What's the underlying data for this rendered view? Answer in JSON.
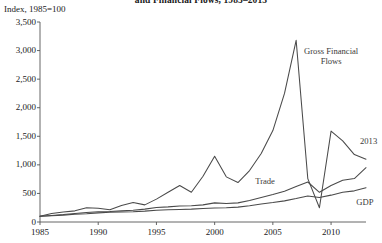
{
  "figure": {
    "title": "and Financial Flows, 1985–2013",
    "axis_note": "Index, 1985=100"
  },
  "chart_data": {
    "type": "line",
    "title": "and Financial Flows, 1985–2013",
    "subtitle": "",
    "xlabel": "",
    "ylabel": "Index, 1985=100",
    "xlim": [
      1985,
      2013
    ],
    "ylim": [
      0,
      3500
    ],
    "grid": false,
    "legend_position": "inline-annotations",
    "ytick_labels": [
      "0",
      "500",
      "1,000",
      "1,500",
      "2,000",
      "2,500",
      "3,000",
      "3,500"
    ],
    "ytick_values": [
      0,
      500,
      1000,
      1500,
      2000,
      2500,
      3000,
      3500
    ],
    "xtick_labels": [
      "1985",
      "1990",
      "1995",
      "2000",
      "2005",
      "2010"
    ],
    "xtick_values": [
      1985,
      1990,
      1995,
      2000,
      2005,
      2010
    ],
    "annotations": [
      {
        "text": "Gross Financial Flows",
        "x": 2007,
        "y": 2950
      },
      {
        "text": "Trade",
        "x": 2004,
        "y": 700
      },
      {
        "text": "GDP",
        "x": 2012,
        "y": 330
      },
      {
        "text": "2013",
        "x": 2013,
        "y": 1400
      }
    ],
    "x": [
      1985,
      1986,
      1987,
      1988,
      1989,
      1990,
      1991,
      1992,
      1993,
      1994,
      1995,
      1996,
      1997,
      1998,
      1999,
      2000,
      2001,
      2002,
      2003,
      2004,
      2005,
      2006,
      2007,
      2008,
      2009,
      2010,
      2011,
      2012,
      2013
    ],
    "series": [
      {
        "name": "Gross Financial Flows",
        "values": [
          100,
          150,
          175,
          195,
          250,
          240,
          215,
          290,
          340,
          300,
          400,
          520,
          640,
          520,
          800,
          1150,
          790,
          690,
          900,
          1200,
          1600,
          2250,
          3180,
          760,
          250,
          1590,
          1420,
          1180,
          1100
        ]
      },
      {
        "name": "Trade",
        "values": [
          100,
          115,
          130,
          150,
          165,
          180,
          185,
          195,
          205,
          225,
          255,
          265,
          280,
          285,
          300,
          335,
          325,
          335,
          375,
          430,
          480,
          540,
          620,
          700,
          520,
          640,
          730,
          760,
          950
        ]
      },
      {
        "name": "GDP",
        "values": [
          100,
          110,
          120,
          135,
          145,
          160,
          170,
          175,
          180,
          190,
          205,
          215,
          220,
          225,
          235,
          245,
          250,
          260,
          285,
          315,
          340,
          370,
          410,
          455,
          430,
          470,
          520,
          545,
          600
        ]
      }
    ]
  }
}
